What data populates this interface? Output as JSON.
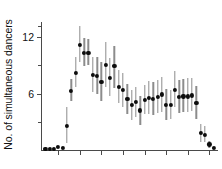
{
  "chart_data": {
    "type": "scatter",
    "title": "",
    "xlabel": "",
    "ylabel": "No. of simultaneous dancers",
    "ylim": [
      0,
      13.6
    ],
    "xlim": [
      0,
      41
    ],
    "grid": false,
    "legend": null,
    "ytick_labels": [
      "6",
      "12"
    ],
    "ytick_values": [
      6,
      12
    ],
    "yminor_tick_values": [
      3,
      9,
      13.2
    ],
    "xtick_values": [
      4,
      9,
      14,
      19,
      24,
      29,
      34,
      39
    ],
    "xtick_labels": [
      "",
      "",
      "",
      "",
      "",
      "",
      "",
      ""
    ],
    "error_bar_style": "vertical-line",
    "marker_style": "filled-circle",
    "x": [
      1,
      2,
      3,
      4,
      5,
      6,
      7,
      8,
      9,
      10,
      11,
      12,
      13,
      14,
      15,
      16,
      17,
      18,
      19,
      20,
      21,
      22,
      23,
      24,
      25,
      26,
      27,
      28,
      29,
      30,
      31,
      32,
      33,
      34,
      35,
      36,
      37,
      38,
      39,
      40
    ],
    "values": [
      0.1,
      0.1,
      0.1,
      0.3,
      0.2,
      2.6,
      6.3,
      8.2,
      11.2,
      10.3,
      10.3,
      8.0,
      7.9,
      7.2,
      9.0,
      7.7,
      8.9,
      6.7,
      6.4,
      5.4,
      4.8,
      5.1,
      4.2,
      5.3,
      5.5,
      5.4,
      5.6,
      5.9,
      4.8,
      4.8,
      6.4,
      5.6,
      5.7,
      5.7,
      5.8,
      5.0,
      1.8,
      1.6,
      0.6,
      0.2
    ],
    "err_low": [
      0.1,
      0.1,
      0.1,
      0.3,
      0.2,
      0.7,
      5.2,
      6.7,
      9.3,
      8.9,
      9.0,
      6.2,
      5.9,
      5.2,
      6.7,
      5.7,
      6.6,
      5.0,
      4.6,
      3.8,
      3.2,
      3.5,
      2.7,
      3.8,
      3.8,
      3.7,
      3.9,
      4.0,
      3.2,
      3.3,
      4.6,
      3.9,
      4.0,
      4.0,
      4.1,
      3.3,
      0.9,
      0.8,
      0.2,
      0.1
    ],
    "err_high": [
      0.1,
      0.1,
      0.1,
      0.3,
      0.2,
      4.6,
      7.5,
      9.9,
      13.2,
      11.9,
      11.8,
      9.9,
      9.9,
      9.3,
      11.5,
      9.8,
      11.1,
      8.5,
      8.2,
      7.0,
      6.4,
      6.7,
      5.7,
      6.9,
      7.3,
      7.2,
      7.4,
      7.8,
      6.5,
      6.4,
      8.4,
      7.4,
      7.5,
      7.6,
      7.6,
      6.8,
      2.8,
      2.5,
      1.0,
      0.3
    ],
    "marker_color": "#0d0d0d",
    "error_color": "#8c8c8c",
    "axis_color": "#4a4a4a",
    "background": "#ffffff"
  }
}
